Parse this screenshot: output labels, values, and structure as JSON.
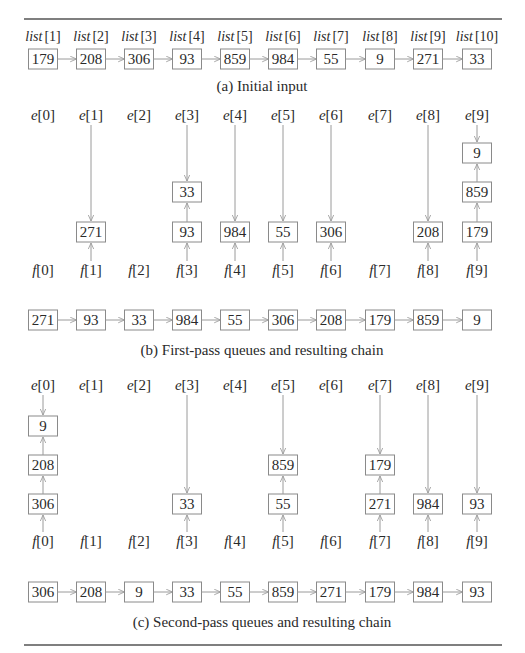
{
  "figure": {
    "initial_input": {
      "labels": [
        "list [1]",
        "list [2]",
        "list [3]",
        "list [4]",
        "list [5]",
        "list [6]",
        "list [7]",
        "list [8]",
        "list [9]",
        "list [10]"
      ],
      "label_prefix": "list",
      "indices": [
        "[1]",
        "[2]",
        "[3]",
        "[4]",
        "[5]",
        "[6]",
        "[7]",
        "[8]",
        "[9]",
        "[10]"
      ],
      "values": [
        "179",
        "208",
        "306",
        "93",
        "859",
        "984",
        "55",
        "9",
        "271",
        "33"
      ],
      "caption": "(a) Initial input"
    },
    "first_pass": {
      "e_labels": [
        "e[0]",
        "e[1]",
        "e[2]",
        "e[3]",
        "e[4]",
        "e[5]",
        "e[6]",
        "e[7]",
        "e[8]",
        "e[9]"
      ],
      "f_labels": [
        "f[0]",
        "f[1]",
        "f[2]",
        "f[3]",
        "f[4]",
        "f[5]",
        "f[6]",
        "f[7]",
        "f[8]",
        "f[9]"
      ],
      "queues": [
        [],
        [
          "271"
        ],
        [],
        [
          "93",
          "33"
        ],
        [
          "984"
        ],
        [
          "55"
        ],
        [
          "306"
        ],
        [],
        [
          "208"
        ],
        [
          "179",
          "859",
          "9"
        ]
      ],
      "chain": [
        "271",
        "93",
        "33",
        "984",
        "55",
        "306",
        "208",
        "179",
        "859",
        "9"
      ],
      "caption": "(b) First-pass queues and resulting chain"
    },
    "second_pass": {
      "e_labels": [
        "e[0]",
        "e[1]",
        "e[2]",
        "e[3]",
        "e[4]",
        "e[5]",
        "e[6]",
        "e[7]",
        "e[8]",
        "e[9]"
      ],
      "f_labels": [
        "f[0]",
        "f[1]",
        "f[2]",
        "f[3]",
        "f[4]",
        "f[5]",
        "f[6]",
        "f[7]",
        "f[8]",
        "f[9]"
      ],
      "queues": [
        [
          "306",
          "208",
          "9"
        ],
        [],
        [],
        [
          "33"
        ],
        [],
        [
          "55",
          "859"
        ],
        [],
        [
          "271",
          "179"
        ],
        [
          "984"
        ],
        [
          "93"
        ]
      ],
      "chain": [
        "306",
        "208",
        "9",
        "33",
        "55",
        "859",
        "271",
        "179",
        "984",
        "93"
      ],
      "caption": "(c) Second-pass queues and resulting chain"
    }
  }
}
